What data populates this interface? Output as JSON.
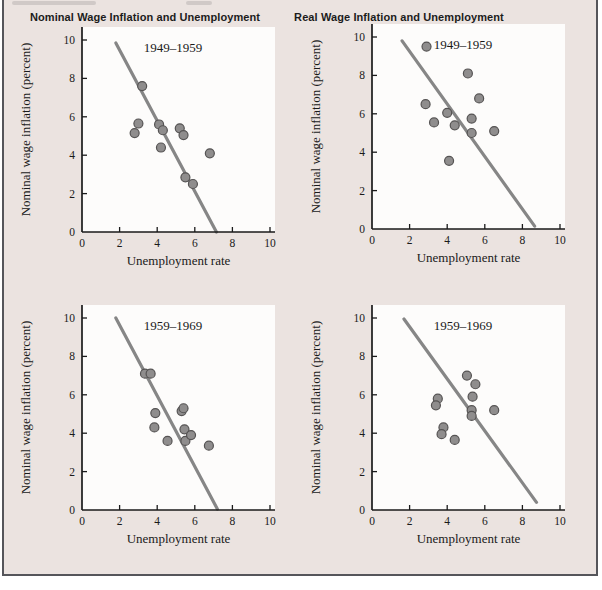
{
  "figure": {
    "column_titles": [
      {
        "label": "Nominal Wage Inflation and Unemployment"
      },
      {
        "label": "Real Wage Inflation and Unemployment"
      }
    ],
    "colors": {
      "background": "#ebe3e0",
      "plot_background": "#fdfcfb",
      "border": "#55555a",
      "axis": "#1a1a1a",
      "text": "#1a1a1a",
      "fit_line": "#868686",
      "dot_fill": "#8f8d8d",
      "dot_stroke": "#555353"
    }
  },
  "chart_data": [
    {
      "type": "scatter",
      "position": "top-left",
      "title": "1949–1959",
      "xlabel": "Unemployment rate",
      "ylabel": "Nominal wage inflation (percent)",
      "xlim": [
        0,
        10
      ],
      "ylim": [
        0,
        10
      ],
      "xticks": [
        0,
        2,
        4,
        6,
        8,
        10
      ],
      "yticks": [
        0,
        2,
        4,
        6,
        8,
        10
      ],
      "grid": false,
      "points": [
        [
          3.2,
          7.6
        ],
        [
          3.0,
          5.65
        ],
        [
          2.8,
          5.15
        ],
        [
          4.1,
          5.6
        ],
        [
          4.3,
          5.3
        ],
        [
          4.2,
          4.4
        ],
        [
          5.2,
          5.4
        ],
        [
          5.4,
          5.05
        ],
        [
          5.5,
          2.85
        ],
        [
          5.9,
          2.5
        ],
        [
          6.8,
          4.1
        ]
      ],
      "fit_line": {
        "x1": 1.8,
        "y1": 9.85,
        "x2": 7.15,
        "y2": 0.0
      }
    },
    {
      "type": "scatter",
      "position": "top-right",
      "title": "1949–1959",
      "xlabel": "Unemployment rate",
      "ylabel": "Nominal wage inflation (percent)",
      "xlim": [
        0,
        10
      ],
      "ylim": [
        0,
        10
      ],
      "xticks": [
        0,
        2,
        4,
        6,
        8,
        10
      ],
      "yticks": [
        0,
        2,
        4,
        6,
        8,
        10
      ],
      "grid": false,
      "points": [
        [
          2.9,
          9.5
        ],
        [
          5.1,
          8.1
        ],
        [
          5.7,
          6.8
        ],
        [
          2.85,
          6.5
        ],
        [
          4.0,
          6.05
        ],
        [
          3.3,
          5.55
        ],
        [
          4.4,
          5.4
        ],
        [
          5.3,
          5.75
        ],
        [
          5.3,
          5.0
        ],
        [
          6.5,
          5.1
        ],
        [
          4.1,
          3.55
        ]
      ],
      "fit_line": {
        "x1": 1.6,
        "y1": 9.8,
        "x2": 8.65,
        "y2": 0.15
      }
    },
    {
      "type": "scatter",
      "position": "bottom-left",
      "title": "1959–1969",
      "xlabel": "Unemployment rate",
      "ylabel": "Nominal wage inflation (percent)",
      "xlim": [
        0,
        10
      ],
      "ylim": [
        0,
        10
      ],
      "xticks": [
        0,
        2,
        4,
        6,
        8,
        10
      ],
      "yticks": [
        0,
        2,
        4,
        6,
        8,
        10
      ],
      "grid": false,
      "points": [
        [
          3.35,
          7.1
        ],
        [
          3.65,
          7.1
        ],
        [
          3.9,
          5.05
        ],
        [
          3.85,
          4.3
        ],
        [
          4.55,
          3.6
        ],
        [
          5.3,
          5.15
        ],
        [
          5.4,
          5.3
        ],
        [
          5.45,
          4.2
        ],
        [
          5.5,
          3.6
        ],
        [
          5.8,
          3.9
        ],
        [
          6.75,
          3.35
        ]
      ],
      "fit_line": {
        "x1": 1.8,
        "y1": 10.0,
        "x2": 7.2,
        "y2": 0.05
      }
    },
    {
      "type": "scatter",
      "position": "bottom-right",
      "title": "1959–1969",
      "xlabel": "Unemployment rate",
      "ylabel": "Nominal wage inflation (percent)",
      "xlim": [
        0,
        10
      ],
      "ylim": [
        0,
        10
      ],
      "xticks": [
        0,
        2,
        4,
        6,
        8,
        10
      ],
      "yticks": [
        0,
        2,
        4,
        6,
        8,
        10
      ],
      "grid": false,
      "points": [
        [
          5.05,
          7.0
        ],
        [
          5.5,
          6.55
        ],
        [
          5.35,
          5.9
        ],
        [
          3.5,
          5.8
        ],
        [
          3.4,
          5.45
        ],
        [
          5.3,
          5.2
        ],
        [
          5.3,
          4.9
        ],
        [
          6.5,
          5.2
        ],
        [
          3.8,
          4.3
        ],
        [
          3.7,
          3.95
        ],
        [
          4.4,
          3.65
        ]
      ],
      "fit_line": {
        "x1": 1.7,
        "y1": 9.95,
        "x2": 8.75,
        "y2": 0.4
      }
    }
  ]
}
